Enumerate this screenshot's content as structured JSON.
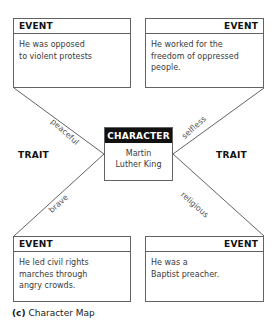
{
  "diagram": {
    "title": "Character Map",
    "caption_index": "(c)",
    "caption_text": "Character Map",
    "colors": {
      "stroke": "#636363",
      "header_fill": "#111111",
      "header_text": "#ffffff",
      "body_text": "#3a3a3a",
      "background": "#ffffff"
    },
    "center": {
      "header": "CHARACTER",
      "name_line1": "Martin",
      "name_line2": "Luther King"
    },
    "trait_side_labels": {
      "left": "TRAIT",
      "right": "TRAIT"
    },
    "edge_labels": {
      "top_left": "peaceful",
      "top_right": "selfless",
      "bottom_left": "brave",
      "bottom_right": "religious"
    },
    "events": [
      {
        "position": "top-left",
        "header": "EVENT",
        "align": "left",
        "lines": [
          "He was opposed",
          "to violent protests"
        ]
      },
      {
        "position": "top-right",
        "header": "EVENT",
        "align": "right",
        "lines": [
          "He worked for the",
          "freedom of oppressed",
          "people."
        ]
      },
      {
        "position": "bottom-left",
        "header": "EVENT",
        "align": "left",
        "lines": [
          "He led civil rights",
          "marches through",
          "angry crowds."
        ]
      },
      {
        "position": "bottom-right",
        "header": "EVENT",
        "align": "right",
        "lines": [
          "He was a",
          "Baptist preacher."
        ]
      }
    ]
  }
}
